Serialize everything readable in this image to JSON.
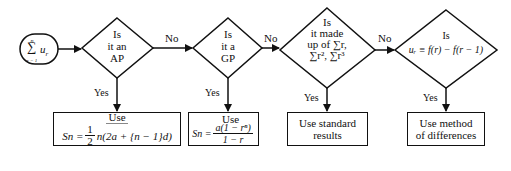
{
  "start": {
    "expr_symbol": "∑",
    "expr_upper": "n",
    "expr_lower": "r = 1",
    "expr_term": "u",
    "expr_term_sub": "r"
  },
  "decisions": [
    {
      "id": "ap",
      "lines": [
        "Is",
        "it an",
        "AP"
      ]
    },
    {
      "id": "gp",
      "lines": [
        "Is",
        "it a",
        "GP"
      ]
    },
    {
      "id": "standard",
      "lines": [
        "Is",
        "it made",
        "up of ∑r,",
        "∑r², ∑r³"
      ]
    },
    {
      "id": "differences",
      "lines": [
        "Is",
        "uᵣ ≡ f(r) − f(r − 1)"
      ]
    }
  ],
  "branch_labels": {
    "no": "No",
    "yes": "Yes"
  },
  "outcomes": [
    {
      "id": "ap-formula",
      "heading": "Use",
      "lhs": "Sn =",
      "frac_num": "1",
      "frac_den": "2",
      "rhs": "n(2a + {n − 1}d)"
    },
    {
      "id": "gp-formula",
      "heading": "Use",
      "lhs": "Sn =",
      "frac_num": "a(1 − rⁿ)",
      "frac_den": "1 − r"
    },
    {
      "id": "standard-results",
      "lines": [
        "Use standard",
        "results"
      ]
    },
    {
      "id": "method-of-differences",
      "lines": [
        "Use method",
        "of differences"
      ]
    }
  ]
}
